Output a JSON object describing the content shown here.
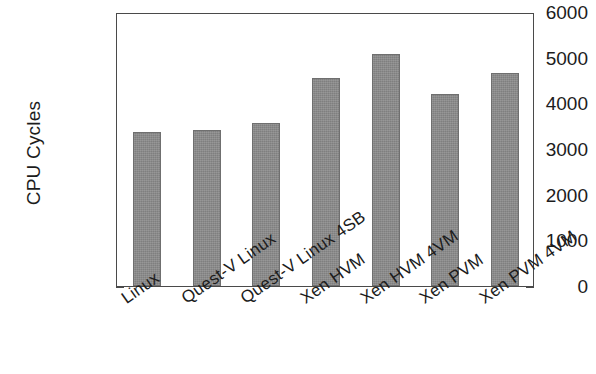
{
  "chart_data": {
    "type": "bar",
    "title": "",
    "subtitle": "",
    "xlabel": "",
    "ylabel": "CPU Cycles",
    "categories": [
      "Linux",
      "Quest-V Linux",
      "Quest-V Linux 4SB",
      "Xen HVM",
      "Xen HVM 4VM",
      "Xen PVM",
      "Xen PVM 4VM"
    ],
    "values": [
      3370,
      3420,
      3570,
      4550,
      5080,
      4200,
      4660
    ],
    "ylim": [
      0,
      6000
    ],
    "yticks": [
      0,
      1000,
      2000,
      3000,
      4000,
      5000,
      6000
    ],
    "ytick_labels": [
      "0",
      "1000",
      "2000",
      "3000",
      "4000",
      "5000",
      "6000"
    ],
    "grid": false,
    "legend": null,
    "bar_color": "#8b8b8b",
    "bar_edge_color": "#6f6f6f",
    "axis_color": "#4a4a4a",
    "background_color": "#ffffff",
    "xlabel_rotation_deg": -35
  }
}
